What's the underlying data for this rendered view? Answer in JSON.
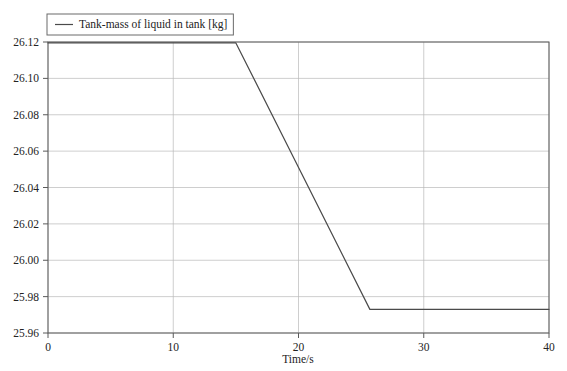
{
  "chart_data": {
    "type": "line",
    "title": "",
    "xlabel": "Time/s",
    "ylabel": "",
    "xlim": [
      0,
      40
    ],
    "ylim": [
      25.96,
      26.12
    ],
    "xticks": [
      0,
      10,
      20,
      30,
      40
    ],
    "yticks": [
      25.96,
      25.98,
      26.0,
      26.02,
      26.04,
      26.06,
      26.08,
      26.1,
      26.12
    ],
    "xtick_labels": [
      "0",
      "10",
      "20",
      "30",
      "40"
    ],
    "ytick_labels": [
      "25.96",
      "25.98",
      "26.00",
      "26.02",
      "26.04",
      "26.06",
      "26.08",
      "26.10",
      "26.12"
    ],
    "grid": true,
    "grid_color": "#b9b9b9",
    "frame_color": "#5a5a5a",
    "legend_position": "top-left-outside",
    "series": [
      {
        "name": "Tank-mass of liquid in tank [kg]",
        "color": "#4a4a4a",
        "x": [
          0,
          15,
          25.7,
          40
        ],
        "values": [
          26.1195,
          26.1195,
          25.973,
          25.973
        ]
      }
    ]
  },
  "legend": {
    "entries": [
      {
        "label": "Tank-mass of liquid in tank [kg]",
        "color": "#4a4a4a"
      }
    ]
  },
  "axes": {
    "x_title": "Time/s"
  }
}
